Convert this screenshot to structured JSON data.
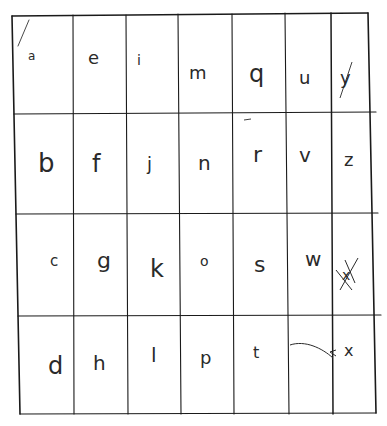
{
  "sheet": {
    "description": "Hand-drawn grid of lowercase alphabet letters written column-wise",
    "grid": {
      "rows": 4,
      "columns": 7
    },
    "columns": [
      [
        "a",
        "b",
        "c",
        "d"
      ],
      [
        "e",
        "f",
        "g",
        "h"
      ],
      [
        "i",
        "j",
        "k",
        "l"
      ],
      [
        "m",
        "n",
        "o",
        "p"
      ],
      [
        "q",
        "r",
        "s",
        "t"
      ],
      [
        "u",
        "v",
        "w",
        ""
      ],
      [
        "y",
        "z",
        "x",
        "x"
      ]
    ],
    "annotations": {
      "crossed_out_cell": "y (column 7, row 3) letter written and struck through",
      "arrow": "curved arrow from empty cell (column 6, row 4) pointing to x"
    }
  }
}
